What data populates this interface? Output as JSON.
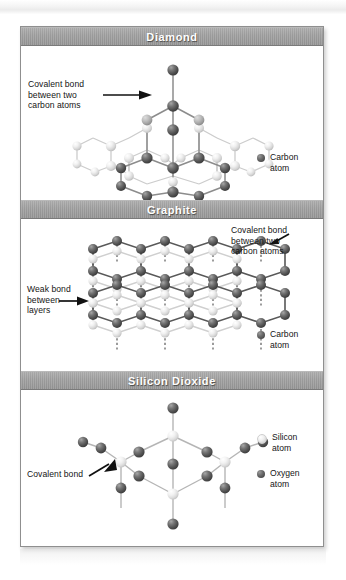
{
  "figure": {
    "panels": [
      {
        "id": "diamond",
        "title": "Diamond",
        "annotation": "Covalent bond\nbetween two\ncarbon atoms",
        "legend": [
          {
            "icon": "dark-sphere-icon",
            "label": "Carbon\natom",
            "color": "#5a5a5a"
          }
        ]
      },
      {
        "id": "graphite",
        "title": "Graphite",
        "annotation_top_right": "Covalent bond\nbetween two\ncarbon atoms",
        "annotation_left": "Weak bond\nbetween\nlayers",
        "legend": [
          {
            "icon": "dark-sphere-icon",
            "label": "Carbon\natom",
            "color": "#5a5a5a"
          }
        ]
      },
      {
        "id": "silicon-dioxide",
        "title": "Silicon Dioxide",
        "annotation": "Covalent bond",
        "legend": [
          {
            "icon": "light-sphere-icon",
            "label": "Silicon\natom",
            "color": "#e4e4e4"
          },
          {
            "icon": "dark-sphere-icon",
            "label": "Oxygen\natom",
            "color": "#5a5a5a"
          }
        ]
      }
    ]
  },
  "colors": {
    "header_bar": "#9b9b9b",
    "header_text": "#ffffff",
    "frame_border": "#8f8f8f",
    "panel_background": "#ffffff",
    "atom_dark": "#5a5a5a",
    "atom_light": "#e4e4e4",
    "bond_dark": "#555555",
    "bond_light": "#c9c9c9"
  }
}
